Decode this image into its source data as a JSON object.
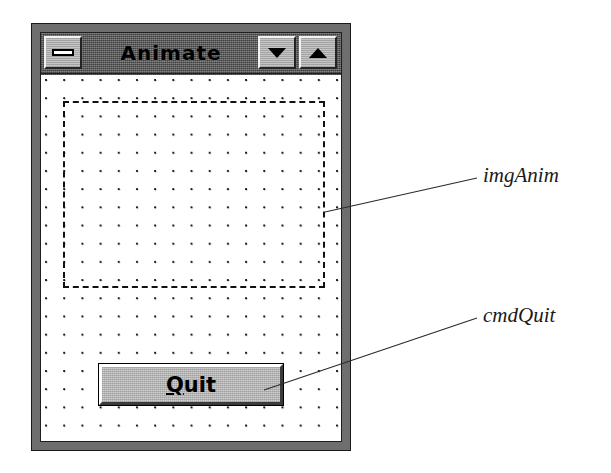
{
  "window": {
    "title": "Animate",
    "titlebar_buttons": [
      {
        "name": "minimize",
        "icon": "minimize-icon",
        "label": "Minimize"
      },
      {
        "name": "restore",
        "icon": "triangle-down-icon",
        "label": "Restore"
      },
      {
        "name": "maximize",
        "icon": "triangle-up-icon",
        "label": "Maximize"
      }
    ]
  },
  "form": {
    "grid": {
      "visible": true,
      "spacing_px": 18
    },
    "controls": [
      {
        "name": "imgAnim",
        "type": "image",
        "selected": false,
        "border_style": "dashed"
      },
      {
        "name": "cmdQuit",
        "type": "command-button",
        "caption": "Quit",
        "accelerator": "Q",
        "caption_before_accel": "",
        "caption_after_accel": "uit"
      }
    ]
  },
  "annotations": [
    {
      "name": "imgAnim-callout",
      "text": "imgAnim"
    },
    {
      "name": "cmdQuit-callout",
      "text": "cmdQuit"
    }
  ],
  "colors": {
    "titlebar_active": "#6b6b6b",
    "frame": "#7a7a7a",
    "button_face": "#b8b8b8",
    "form_background": "#ffffff",
    "grid_dot": "#1a1a1a",
    "text": "#000000"
  }
}
